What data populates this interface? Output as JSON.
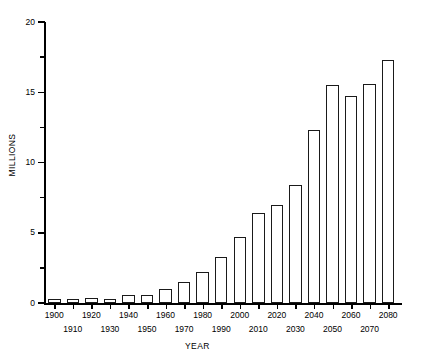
{
  "chart_data": {
    "type": "bar",
    "title": "",
    "subtitle": "",
    "xlabel": "YEAR",
    "ylabel": "MILLIONS",
    "categories": [
      "1900",
      "1910",
      "1920",
      "1930",
      "1940",
      "1950",
      "1960",
      "1970",
      "1980",
      "1990",
      "2000",
      "2010",
      "2020",
      "2030",
      "2040",
      "2050",
      "2060",
      "2070",
      "2080"
    ],
    "values": [
      0.3,
      0.3,
      0.35,
      0.3,
      0.55,
      0.55,
      1.0,
      1.5,
      2.2,
      3.3,
      4.7,
      6.4,
      7.0,
      8.4,
      12.3,
      15.5,
      14.7,
      15.6,
      17.3
    ],
    "series": [
      {
        "name": "Population",
        "values": [
          0.3,
          0.3,
          0.35,
          0.3,
          0.55,
          0.55,
          1.0,
          1.5,
          2.2,
          3.3,
          4.7,
          6.4,
          7.0,
          8.4,
          12.3,
          15.5,
          14.7,
          15.6,
          17.3
        ]
      }
    ],
    "ylim": [
      0,
      20
    ],
    "xlim": [
      1900,
      2080
    ],
    "y_major_ticks": [
      0,
      5,
      10,
      15,
      20
    ],
    "y_minor_ticks": [
      2.5,
      7.5,
      12.5,
      17.5
    ],
    "y_tick_labels": [
      "0",
      "5",
      "10",
      "15",
      "20"
    ],
    "grid": false,
    "legend": "none",
    "bar_fill": "#ffffff",
    "bar_edge": "#1a1a1a",
    "axis_color": "#000000"
  },
  "axis": {
    "y_title": "MILLIONS",
    "x_title": "YEAR",
    "y_labels": [
      "0",
      "5",
      "10",
      "15",
      "20"
    ],
    "x_labels_upper": [
      "1900",
      "1920",
      "1940",
      "1960",
      "1980",
      "2000",
      "2020",
      "2040",
      "2060",
      "2080"
    ],
    "x_labels_lower": [
      "1910",
      "1930",
      "1950",
      "1970",
      "1990",
      "2010",
      "2030",
      "2050",
      "2070"
    ]
  }
}
